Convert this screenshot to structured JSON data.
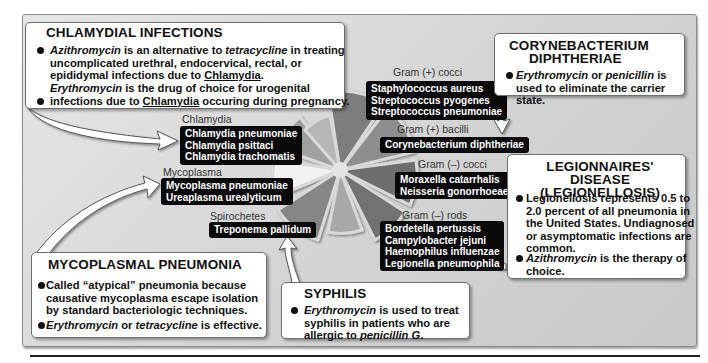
{
  "callouts": {
    "chlamydial": {
      "title": "CHLAMYDIAL INFECTIONS",
      "b1_drug": "Azithromycin",
      "b1_a": " is an alternative to ",
      "b1_drug2": "tetracycline",
      "b1_b": " in treating uncomplicated urethral, endocervical, rectal, or epididymal infections due to ",
      "b1_org": "Chlamydia",
      "b1_end": ".",
      "b2_drug": "Erythromycin",
      "b2_a": " is the drug of choice for urogenital infections due to ",
      "b2_org": "Chlamydia",
      "b2_end": " occuring during pregnancy."
    },
    "corynebacterium": {
      "title_line1": "CORYNEBACTERIUM",
      "title_line2": "DIPHTHERIAE",
      "b1_drug": "Erythromycin",
      "b1_a": " or ",
      "b1_drug2": "penicillin",
      "b1_b": " is used to eliminate the carrier state."
    },
    "legionnaires": {
      "title_line1": "LEGIONNAIRES' DISEASE",
      "title_line2": "(LEGIONELLOSIS)",
      "b1": "Legionellosis represents 0.5 to 2.0 percent of all pneumonia in the United States. Undiagnosed or asymptomatic infections are common.",
      "b2_drug": "Azithromycin",
      "b2_a": " is the therapy of choice."
    },
    "mycoplasmal": {
      "title": "MYCOPLASMAL PNEUMONIA",
      "b1": "Called “atypical” pneumonia because causative mycoplasma escape isolation by standard  bacteriologic techniques.",
      "b2_drug": "Erythromycin",
      "b2_a": " or ",
      "b2_drug2": "tetracycline",
      "b2_b": " is effective."
    },
    "syphilis": {
      "title": "SYPHILIS",
      "b1_drug": "Erythromycin",
      "b1_a": " is used to treat syphilis in patients who are allergic to ",
      "b1_drug2": "penicillin G",
      "b1_end": "."
    }
  },
  "groups": {
    "gram_pos_cocci": {
      "label": "Gram (+) cocci",
      "organisms": [
        "Staphylococcus aureus",
        "Streptococcus pyogenes",
        "Streptococcus pneumoniae"
      ]
    },
    "gram_pos_bacilli": {
      "label": "Gram (+) bacilli",
      "organisms": [
        "Corynebacterium diphtheriae"
      ]
    },
    "gram_neg_cocci": {
      "label": "Gram (–) cocci",
      "organisms": [
        "Moraxella catarrhalis",
        "Neisseria gonorrhoeae"
      ]
    },
    "gram_neg_rods": {
      "label": "Gram (–) rods",
      "organisms": [
        "Bordetella pertussis",
        "Campylobacter jejuni",
        "Haemophilus influenzae",
        "Legionella pneumophila"
      ]
    },
    "chlamydia": {
      "label": "Chlamydia",
      "organisms": [
        "Chlamydia pneumoniae",
        "Chlamydia psittaci",
        "Chlamydia trachomatis"
      ]
    },
    "mycoplasma": {
      "label": "Mycoplasma",
      "organisms": [
        "Mycoplasma pneumoniae",
        "Ureaplasma urealyticum"
      ]
    },
    "spirochetes": {
      "label": "Spirochetes",
      "organisms": [
        "Treponema pallidum"
      ]
    }
  },
  "wheel": {
    "colors": {
      "gram_pos_cocci": "#7a7a7a",
      "gram_pos_bacilli": "#8e8e8e",
      "gram_neg_cocci": "#6e6e6e",
      "gram_neg_rods": "#747474",
      "small_bottom": "#a8a8a8",
      "spirochetes": "#858585",
      "mycoplasma": "#f0f0f0",
      "chlamydia": "#a0a0a0",
      "small_top": "#b5b5b5"
    }
  }
}
